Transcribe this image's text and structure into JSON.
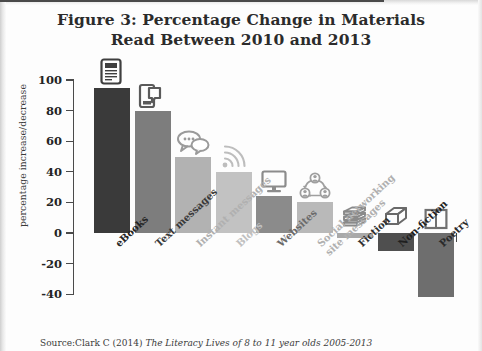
{
  "figure": {
    "title_line1": "Figure 3: Percentage Change in Materials",
    "title_line2": "Read Between 2010 and 2013",
    "source_prefix": "Source:Clark C (2014) ",
    "source_italic": "The Literacy Lives of 8 to 11 year olds 2005-2013",
    "source_suffix": ""
  },
  "chart_data": {
    "type": "bar",
    "title": "Figure 3: Percentage Change in Materials Read Between 2010 and 2013",
    "xlabel": "",
    "ylabel": "percentage increase/decrease",
    "ylim": [
      -40,
      100
    ],
    "yticks": [
      100,
      80,
      60,
      40,
      20,
      0,
      -20,
      -40
    ],
    "ytick_labels": [
      "100",
      "80",
      "60",
      "40",
      "20",
      "0",
      "-20",
      "-40"
    ],
    "grid": false,
    "legend": "none",
    "categories": [
      "eBooks",
      "Text messages",
      "Instant messages",
      "Blogs",
      "Websites",
      "Social networking site messages",
      "Fiction",
      "Non-fiction",
      "Poetry"
    ],
    "values": [
      95,
      80,
      50,
      40,
      24,
      20,
      -3,
      -12,
      -42
    ],
    "bar_colors": [
      "#3a3a3a",
      "#7d7d7d",
      "#b2b2b2",
      "#c2c2c2",
      "#8b8b8b",
      "#b9b9b9",
      "#a9a9a9",
      "#4f4f4f",
      "#6e6e6e"
    ],
    "label_colors": [
      "#242424",
      "#3a3a3a",
      "#b0b0b0",
      "#c0c0c0",
      "#6b6b6b",
      "#b0b0b0",
      "#303030",
      "#1f1f1f",
      "#2a2a2a"
    ],
    "icons": [
      "e-reader-icon",
      "smartphone-icon",
      "speech-bubbles-icon",
      "rss-wifi-icon",
      "monitor-icon",
      "social-network-icon",
      "book-stack-icon",
      "closed-book-icon",
      "open-book-icon"
    ]
  },
  "category_labels": [
    {
      "line1": "eBooks",
      "line2": ""
    },
    {
      "line1": "Text messages",
      "line2": ""
    },
    {
      "line1": "Instant messages",
      "line2": ""
    },
    {
      "line1": "Blogs",
      "line2": ""
    },
    {
      "line1": "Websites",
      "line2": ""
    },
    {
      "line1": "Social networking",
      "line2": "site messages"
    },
    {
      "line1": "Fiction",
      "line2": ""
    },
    {
      "line1": "Non-fiction",
      "line2": ""
    },
    {
      "line1": "Poetry",
      "line2": ""
    }
  ]
}
